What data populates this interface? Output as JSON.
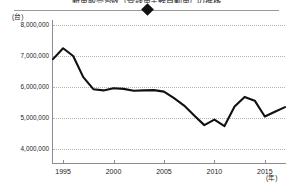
{
  "chart_title": "新車販売台数（登録車＋軽自動車）の推移",
  "legend": {
    "marker_shape": "diamond-marker",
    "marker_color": "#111111",
    "rule_color": "#9a9a9a"
  },
  "axes": {
    "y_unit": "(台)",
    "x_unit": "(年)",
    "y_ticks": [
      "8,000,000",
      "7,000,000",
      "6,000,000",
      "5,000,000",
      "4,000,000"
    ],
    "x_ticks": [
      "1995",
      "2000",
      "2005",
      "2010",
      "2015"
    ]
  },
  "chart_data": {
    "type": "line",
    "title": "新車販売台数（登録車＋軽自動車）の推移",
    "xlabel": "(年)",
    "ylabel": "(台)",
    "ylim": [
      4000000,
      8000000
    ],
    "xlim": [
      1994,
      2017
    ],
    "grid": true,
    "legend_position": "top",
    "line_color": "#111111",
    "line_width": 2.1,
    "y_tick_values": [
      8000000,
      7000000,
      6000000,
      5000000,
      4000000
    ],
    "x_tick_values": [
      1995,
      2000,
      2005,
      2010,
      2015
    ],
    "x": [
      1994,
      1995,
      1996,
      1997,
      1998,
      1999,
      2000,
      2001,
      2002,
      2003,
      2004,
      2005,
      2006,
      2007,
      2008,
      2009,
      2010,
      2011,
      2012,
      2013,
      2014,
      2015,
      2016,
      2017
    ],
    "series": [
      {
        "name": "新車販売台数",
        "values": [
          6900000,
          7250000,
          7000000,
          6320000,
          5930000,
          5890000,
          5960000,
          5940000,
          5880000,
          5890000,
          5900000,
          5850000,
          5640000,
          5400000,
          5080000,
          4770000,
          4950000,
          4740000,
          5370000,
          5680000,
          5560000,
          5050000,
          5200000,
          5350000
        ]
      }
    ]
  }
}
